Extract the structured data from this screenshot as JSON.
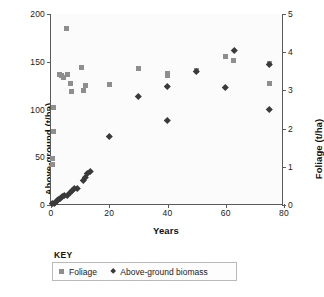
{
  "chart_data": {
    "type": "scatter",
    "title": "",
    "xlabel": "Years",
    "ylabel": "Above-ground (t/ha)",
    "y2label": "Foliage (t/ha)",
    "xlim": [
      0,
      80
    ],
    "ylim": [
      0,
      200
    ],
    "y2lim": [
      0,
      5
    ],
    "xticks": [
      0,
      20,
      40,
      60,
      80
    ],
    "xtick_labels": [
      "0",
      "20",
      "40",
      "60",
      "80"
    ],
    "yticks": [
      0,
      50,
      100,
      150,
      200
    ],
    "ytick_labels": [
      "0",
      "50",
      "100",
      "150",
      "200"
    ],
    "y2ticks": [
      0,
      1,
      2,
      3,
      4,
      5
    ],
    "y2tick_labels": [
      "0",
      "1",
      "2",
      "3",
      "4",
      "5"
    ],
    "grid": false,
    "legend_position": "below",
    "series": [
      {
        "name": "Foliage",
        "marker": "square",
        "color": "#8e8e8e",
        "axis": "right",
        "points": [
          {
            "x": 0.6,
            "y": 1.07
          },
          {
            "x": 0.6,
            "y": 1.22
          },
          {
            "x": 0.8,
            "y": 1.93
          },
          {
            "x": 0.8,
            "y": 2.55
          },
          {
            "x": 3.0,
            "y": 3.42
          },
          {
            "x": 3.6,
            "y": 3.4
          },
          {
            "x": 4.2,
            "y": 3.33
          },
          {
            "x": 5.4,
            "y": 4.62
          },
          {
            "x": 5.6,
            "y": 3.42
          },
          {
            "x": 6.6,
            "y": 3.18
          },
          {
            "x": 7.2,
            "y": 2.98
          },
          {
            "x": 10.6,
            "y": 3.6
          },
          {
            "x": 11.2,
            "y": 2.99
          },
          {
            "x": 12.0,
            "y": 3.12
          },
          {
            "x": 20.0,
            "y": 3.15
          },
          {
            "x": 30.0,
            "y": 3.57
          },
          {
            "x": 40.0,
            "y": 3.43
          },
          {
            "x": 40.0,
            "y": 3.38
          },
          {
            "x": 50.0,
            "y": 3.52
          },
          {
            "x": 60.0,
            "y": 3.88
          },
          {
            "x": 62.5,
            "y": 3.77
          },
          {
            "x": 75.0,
            "y": 3.7
          },
          {
            "x": 75.0,
            "y": 3.17
          }
        ]
      },
      {
        "name": "Above-ground biomass",
        "marker": "diamond",
        "color": "#3a3a3a",
        "axis": "left",
        "points": [
          {
            "x": 0.5,
            "y": 1.5
          },
          {
            "x": 1.0,
            "y": 2.0
          },
          {
            "x": 1.4,
            "y": 3.0
          },
          {
            "x": 2.0,
            "y": 4.5
          },
          {
            "x": 2.6,
            "y": 6.0
          },
          {
            "x": 3.2,
            "y": 7.5
          },
          {
            "x": 3.8,
            "y": 9.0
          },
          {
            "x": 4.4,
            "y": 10.0
          },
          {
            "x": 5.6,
            "y": 10.5
          },
          {
            "x": 6.6,
            "y": 13.5
          },
          {
            "x": 7.4,
            "y": 15.0
          },
          {
            "x": 8.0,
            "y": 17.5
          },
          {
            "x": 9.0,
            "y": 18.0
          },
          {
            "x": 11.0,
            "y": 26.0
          },
          {
            "x": 11.8,
            "y": 29.5
          },
          {
            "x": 12.6,
            "y": 33.0
          },
          {
            "x": 13.4,
            "y": 35.5
          },
          {
            "x": 20.0,
            "y": 72.0
          },
          {
            "x": 30.0,
            "y": 113.5
          },
          {
            "x": 40.0,
            "y": 89.0
          },
          {
            "x": 40.0,
            "y": 124.5
          },
          {
            "x": 50.0,
            "y": 140.5
          },
          {
            "x": 60.0,
            "y": 123.0
          },
          {
            "x": 63.0,
            "y": 162.5
          },
          {
            "x": 75.0,
            "y": 100.0
          },
          {
            "x": 75.0,
            "y": 147.5
          }
        ]
      }
    ]
  },
  "legend": {
    "title": "KEY",
    "entries": [
      {
        "label": "Foliage",
        "marker": "square"
      },
      {
        "label": "Above-ground biomass",
        "marker": "diamond"
      }
    ]
  }
}
